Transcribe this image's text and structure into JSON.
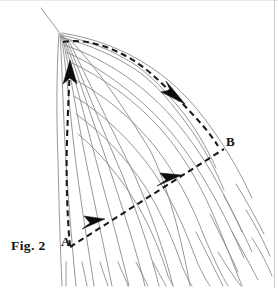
{
  "figure": {
    "caption": "Fig. 2",
    "labels": {
      "a": "A",
      "b": "B"
    },
    "colors": {
      "background": "#ffffff",
      "flowlines": "#8b8b8b",
      "dashed_path": "#1a1a1a",
      "arrowhead": "#0d0d0d",
      "label_text": "#111111",
      "border": "#c9c9c9"
    },
    "icons": {
      "arrow_up": "arrow-up-icon",
      "arrow_down_right": "arrow-down-right-icon",
      "arrow_up_right_lower": "arrow-up-right-icon",
      "arrow_up_right_mid": "arrow-up-right-icon"
    },
    "geometry": {
      "apex": [
        59,
        32
      ],
      "point_a": [
        72,
        246
      ],
      "point_b": [
        224,
        148
      ],
      "arrow_up_tip": [
        70,
        62
      ],
      "arrow_curve_tip": [
        182,
        100
      ],
      "arrow_diag_low_tip": [
        103,
        221
      ],
      "arrow_diag_mid_tip": [
        180,
        177
      ]
    }
  }
}
